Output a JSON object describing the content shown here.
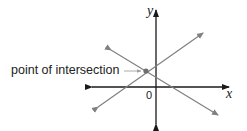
{
  "diagram": {
    "labels": {
      "point_of_intersection": "point of intersection",
      "y_axis": "y",
      "x_axis": "x",
      "origin": "0"
    },
    "colors": {
      "axis": "#1a1a1a",
      "line": "#808080",
      "point": "#6e6e6e",
      "pointer": "#a0a0a0",
      "text": "#222222"
    },
    "axes": {
      "x": {
        "x1": 92,
        "y1": 87,
        "x2": 229,
        "y2": 87
      },
      "y": {
        "x1": 156,
        "y1": 124,
        "x2": 156,
        "y2": 10
      }
    },
    "lines": [
      {
        "name": "rising-line",
        "x1": 98,
        "y1": 107,
        "x2": 203,
        "y2": 33
      },
      {
        "name": "falling-line",
        "x1": 111,
        "y1": 50,
        "x2": 218,
        "y2": 115
      }
    ],
    "intersection": {
      "cx": 146,
      "cy": 71
    },
    "pointer": {
      "x1": 125,
      "y1": 71,
      "x2": 141,
      "y2": 71
    }
  }
}
